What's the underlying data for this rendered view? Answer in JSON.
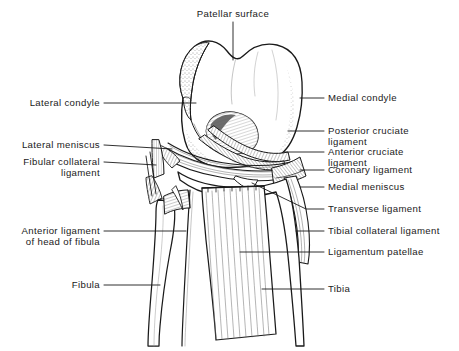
{
  "figure": {
    "width": 459,
    "height": 351,
    "background_color": "#ffffff",
    "ink_color": "#1a1a1a"
  },
  "labels": {
    "patellar_surface": "Patellar surface",
    "lateral_condyle": "Lateral condyle",
    "lateral_meniscus": "Lateral meniscus",
    "fibular_collateral_ligament_line1": "Fibular collateral",
    "fibular_collateral_ligament_line2": "ligament",
    "anterior_ligament_fibula_line1": "Anterior ligament",
    "anterior_ligament_fibula_line2": "of head of fibula",
    "fibula": "Fibula",
    "medial_condyle": "Medial condyle",
    "posterior_cruciate_ligament_line1": "Posterior cruciate",
    "posterior_cruciate_ligament_line2": "ligament",
    "anterior_cruciate_ligament_line1": "Anterior cruciate",
    "anterior_cruciate_ligament_line2": "ligament",
    "coronary_ligament": "Coronary ligament",
    "medial_meniscus": "Medial meniscus",
    "transverse_ligament": "Transverse ligament",
    "tibial_collateral_ligament": "Tibial collateral ligament",
    "ligamentum_patellae": "Ligamentum patellae",
    "tibia": "Tibia"
  }
}
